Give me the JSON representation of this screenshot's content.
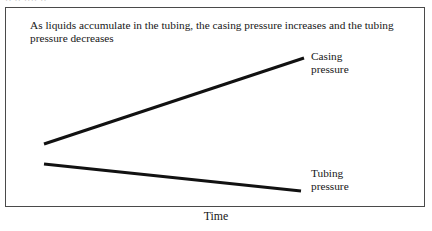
{
  "figure": {
    "caption": "As liquids accumulate in the tubing, the casing pressure increases and the tubing pressure decreases",
    "top_remnant_text": "·· ·· ···· ··",
    "axis_title_x": "Time",
    "frame_color": "#4a4a4a",
    "line_color": "#111111",
    "background_color": "#ffffff"
  },
  "labels": {
    "casing_line1": "Casing",
    "casing_line2": "pressure",
    "tubing_line1": "Tubing",
    "tubing_line2": "pressure"
  },
  "chart_data": {
    "type": "line",
    "title": "As liquids accumulate in the tubing, the casing pressure increases and the tubing pressure decreases",
    "xlabel": "Time",
    "ylabel": "",
    "grid": false,
    "legend": "inline-right-of-line-ends",
    "xlim": [
      0,
      1
    ],
    "ylim": [
      0,
      1
    ],
    "axes_visible": false,
    "tick_labels_x": [],
    "tick_labels_y": [],
    "series": [
      {
        "name": "Casing pressure",
        "color": "#111111",
        "line_width_px": 3,
        "x": [
          0.09,
          0.71
        ],
        "y": [
          0.32,
          0.74
        ],
        "trend": "increasing",
        "points_px": [
          [
            43,
            143
          ],
          [
            303,
            57
          ]
        ]
      },
      {
        "name": "Tubing pressure",
        "color": "#111111",
        "line_width_px": 3,
        "x": [
          0.09,
          0.7
        ],
        "y": [
          0.22,
          0.09
        ],
        "trend": "decreasing",
        "points_px": [
          [
            43,
            163
          ],
          [
            300,
            190
          ]
        ]
      }
    ],
    "annotations": [
      {
        "text": "Casing pressure",
        "anchor_px": [
          311,
          51
        ]
      },
      {
        "text": "Tubing pressure",
        "anchor_px": [
          311,
          168
        ]
      }
    ]
  }
}
